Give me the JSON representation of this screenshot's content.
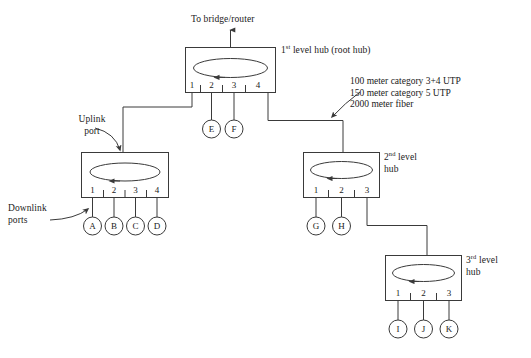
{
  "diagram": {
    "background_color": "#ffffff",
    "line_color": "#3a3a3a",
    "text_color": "#1a1a1a",
    "uplink_note": "To bridge/router",
    "labels": {
      "uplink_port_line1": "Uplink",
      "uplink_port_line2": "port",
      "downlink_ports_line1": "Downlink",
      "downlink_ports_line2": "ports"
    },
    "cable_specs": [
      "100 meter category 3+4 UTP",
      "150 meter category 5 UTP",
      "2000 meter fiber"
    ],
    "hubs": [
      {
        "id": "root-hub",
        "label_line1": "1",
        "label_sup": "st",
        "label_line1_rest": " level hub (root hub)",
        "label_line2": "",
        "ports": [
          "1",
          "2",
          "3",
          "4"
        ]
      },
      {
        "id": "left-second-level-hub",
        "label_line1": "",
        "label_sup": "",
        "label_line1_rest": "",
        "label_line2": "",
        "ports": [
          "1",
          "2",
          "3",
          "4"
        ]
      },
      {
        "id": "right-second-level-hub",
        "label_line1": "2",
        "label_sup": "nd",
        "label_line1_rest": " level",
        "label_line2": "hub",
        "ports": [
          "1",
          "2",
          "3"
        ]
      },
      {
        "id": "third-level-hub",
        "label_line1": "3",
        "label_sup": "rd",
        "label_line1_rest": " level",
        "label_line2": "hub",
        "ports": [
          "1",
          "2",
          "3"
        ]
      }
    ],
    "nodes": [
      {
        "id": "node-a",
        "label": "A"
      },
      {
        "id": "node-b",
        "label": "B"
      },
      {
        "id": "node-c",
        "label": "C"
      },
      {
        "id": "node-d",
        "label": "D"
      },
      {
        "id": "node-e",
        "label": "E"
      },
      {
        "id": "node-f",
        "label": "F"
      },
      {
        "id": "node-g",
        "label": "G"
      },
      {
        "id": "node-h",
        "label": "H"
      },
      {
        "id": "node-i",
        "label": "I"
      },
      {
        "id": "node-j",
        "label": "J"
      },
      {
        "id": "node-k",
        "label": "K"
      }
    ]
  }
}
